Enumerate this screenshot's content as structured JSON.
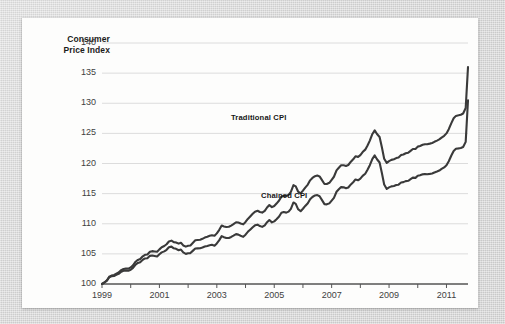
{
  "figure": {
    "background_color": "#d6d6d6",
    "card_color": "#fdfdfc",
    "line_color": "#3a3a3a",
    "grid_color": "#dcdcdc",
    "axis_color": "#555555"
  },
  "chart_data": {
    "type": "line",
    "title": "",
    "ylabel": "Consumer\nPrice Index",
    "ylabel_line1": "Consumer",
    "ylabel_line2": "Price Index",
    "xlabel": "",
    "grid": true,
    "legend_position": "inline-annotations",
    "ylim": [
      100,
      140
    ],
    "xlim": [
      1999,
      2011.75
    ],
    "yticks": [
      100,
      105,
      110,
      115,
      120,
      125,
      130,
      135,
      140
    ],
    "ytick_labels": [
      "100",
      "105",
      "110",
      "115",
      "120",
      "125",
      "130",
      "135",
      "140"
    ],
    "xticks": [
      1999,
      2000,
      2001,
      2002,
      2003,
      2004,
      2005,
      2006,
      2007,
      2008,
      2009,
      2010,
      2011
    ],
    "xtick_labels_shown": [
      "1999",
      "2001",
      "2003",
      "2005",
      "2007",
      "2009",
      "2011"
    ],
    "annotations": [
      {
        "text": "Traditional CPI",
        "x": 2005.0,
        "y": 125.2
      },
      {
        "text": "Chained CPI",
        "x": 2006.0,
        "y": 112.6
      }
    ],
    "series": [
      {
        "name": "Traditional CPI",
        "color": "#3a3a3a",
        "x": [
          1999.0,
          1999.08,
          1999.17,
          1999.25,
          1999.33,
          1999.42,
          1999.5,
          1999.58,
          1999.67,
          1999.75,
          1999.83,
          1999.92,
          2000.0,
          2000.08,
          2000.17,
          2000.25,
          2000.33,
          2000.42,
          2000.5,
          2000.58,
          2000.67,
          2000.75,
          2000.83,
          2000.92,
          2001.0,
          2001.08,
          2001.17,
          2001.25,
          2001.33,
          2001.42,
          2001.5,
          2001.58,
          2001.67,
          2001.75,
          2001.83,
          2001.92,
          2002.0,
          2002.08,
          2002.17,
          2002.25,
          2002.33,
          2002.42,
          2002.5,
          2002.58,
          2002.67,
          2002.75,
          2002.83,
          2002.92,
          2003.0,
          2003.08,
          2003.17,
          2003.25,
          2003.33,
          2003.42,
          2003.5,
          2003.58,
          2003.67,
          2003.75,
          2003.83,
          2003.92,
          2004.0,
          2004.08,
          2004.17,
          2004.25,
          2004.33,
          2004.42,
          2004.5,
          2004.58,
          2004.67,
          2004.75,
          2004.83,
          2004.92,
          2005.0,
          2005.08,
          2005.17,
          2005.25,
          2005.33,
          2005.42,
          2005.5,
          2005.58,
          2005.67,
          2005.75,
          2005.83,
          2005.92,
          2006.0,
          2006.08,
          2006.17,
          2006.25,
          2006.33,
          2006.42,
          2006.5,
          2006.58,
          2006.67,
          2006.75,
          2006.83,
          2006.92,
          2007.0,
          2007.08,
          2007.17,
          2007.25,
          2007.33,
          2007.42,
          2007.5,
          2007.58,
          2007.67,
          2007.75,
          2007.83,
          2007.92,
          2008.0,
          2008.08,
          2008.17,
          2008.25,
          2008.33,
          2008.42,
          2008.5,
          2008.58,
          2008.67,
          2008.75,
          2008.83,
          2008.92,
          2009.0,
          2009.08,
          2009.17,
          2009.25,
          2009.33,
          2009.42,
          2009.5,
          2009.58,
          2009.67,
          2009.75,
          2009.83,
          2009.92,
          2010.0,
          2010.08,
          2010.17,
          2010.25,
          2010.33,
          2010.42,
          2010.5,
          2010.58,
          2010.67,
          2010.75,
          2010.83,
          2010.92,
          2011.0,
          2011.08,
          2011.17,
          2011.25,
          2011.33,
          2011.42,
          2011.5,
          2011.58,
          2011.67
        ],
        "y": [
          100.0,
          100.25,
          100.6,
          101.2,
          101.4,
          101.5,
          101.7,
          101.9,
          102.3,
          102.5,
          102.55,
          102.55,
          102.75,
          103.1,
          103.7,
          104.0,
          104.15,
          104.6,
          104.85,
          104.9,
          105.35,
          105.45,
          105.4,
          105.35,
          105.75,
          106.1,
          106.3,
          106.6,
          107.05,
          107.2,
          106.95,
          106.9,
          106.7,
          106.85,
          106.4,
          106.2,
          106.35,
          106.4,
          106.85,
          107.25,
          107.3,
          107.35,
          107.5,
          107.7,
          107.85,
          108.0,
          108.1,
          108.0,
          108.4,
          108.95,
          109.7,
          109.55,
          109.45,
          109.5,
          109.7,
          109.95,
          110.25,
          110.2,
          110.05,
          109.9,
          110.3,
          110.8,
          111.25,
          111.65,
          112.0,
          112.15,
          111.95,
          111.85,
          112.15,
          112.7,
          113.1,
          112.75,
          112.95,
          113.35,
          113.85,
          114.5,
          114.65,
          114.6,
          114.8,
          115.3,
          116.4,
          116.2,
          115.35,
          115.05,
          115.5,
          116.0,
          116.5,
          117.2,
          117.6,
          117.9,
          118.0,
          117.85,
          117.2,
          116.6,
          116.6,
          116.8,
          117.3,
          117.8,
          118.85,
          119.3,
          119.7,
          119.7,
          119.6,
          119.75,
          120.3,
          120.7,
          121.2,
          121.1,
          121.4,
          121.9,
          122.3,
          123.0,
          123.8,
          124.9,
          125.5,
          124.9,
          124.4,
          122.7,
          120.8,
          120.1,
          120.4,
          120.6,
          120.7,
          120.9,
          121.0,
          121.4,
          121.5,
          121.7,
          121.8,
          122.1,
          122.4,
          122.4,
          122.8,
          122.9,
          123.1,
          123.2,
          123.2,
          123.3,
          123.4,
          123.6,
          123.8,
          124.0,
          124.3,
          124.6,
          125.0,
          125.7,
          126.7,
          127.5,
          127.9,
          128.0,
          128.1,
          128.3,
          129.2
        ],
        "end_value": 136.0
      },
      {
        "name": "Chained CPI",
        "color": "#3a3a3a",
        "end_value": 130.5
      }
    ]
  },
  "axis": {
    "ylabel_line1": "Consumer",
    "ylabel_line2": "Price Index"
  }
}
